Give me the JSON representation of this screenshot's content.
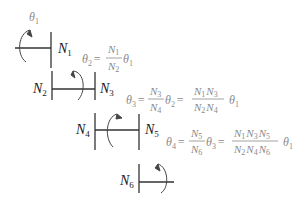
{
  "diagram": {
    "type": "gear-train",
    "input_label": {
      "symbol": "θ",
      "sub": "1"
    },
    "gears": [
      {
        "id": "N1",
        "symbol": "N",
        "sub": "1"
      },
      {
        "id": "N2",
        "symbol": "N",
        "sub": "2"
      },
      {
        "id": "N3",
        "symbol": "N",
        "sub": "3"
      },
      {
        "id": "N4",
        "symbol": "N",
        "sub": "4"
      },
      {
        "id": "N5",
        "symbol": "N",
        "sub": "5"
      },
      {
        "id": "N6",
        "symbol": "N",
        "sub": "6"
      }
    ],
    "equations": [
      {
        "text": "θ2 = (N1/N2) θ1"
      },
      {
        "text": "θ3 = (N3/N4) θ2 = (N1 N3)/(N2 N4) θ1"
      },
      {
        "text": "θ4 = (N5/N6) θ3 = (N1 N3 N5)/(N2 N4 N6) θ1"
      }
    ],
    "colors": {
      "lines": "#333333",
      "labels": "#1a1a1a",
      "equations": "#8a8a8a"
    }
  },
  "t": {
    "theta": "θ",
    "N": "N",
    "eq": "=",
    "s1": "1",
    "s2": "2",
    "s3": "3",
    "s4": "4",
    "s5": "5",
    "s6": "6"
  }
}
